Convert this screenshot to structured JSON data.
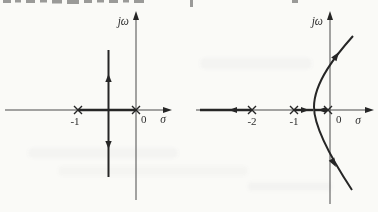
{
  "figure": {
    "type": "root-locus-sketch-pair",
    "ink_color": "#262626",
    "paper_color": "#fafaf7",
    "plots": {
      "left": {
        "y_axis_label": "jω",
        "x_axis_label": "σ",
        "origin_label": "0",
        "tick_labels": [
          "-1"
        ],
        "poles_sigma": [
          -1,
          0
        ],
        "real_axis_locus_segments": [
          [
            -1,
            0
          ]
        ],
        "breakaway_sigma": -0.5,
        "complex_branches": "vertical line through σ = -0.5",
        "branch_arrow_directions": [
          "up",
          "down"
        ]
      },
      "right": {
        "y_axis_label": "jω",
        "x_axis_label": "σ",
        "origin_label": "0",
        "tick_labels": [
          "-2",
          "-1"
        ],
        "poles_sigma": [
          -2,
          -1,
          0
        ],
        "real_axis_locus_segments": [
          [
            "-infinity",
            -2
          ],
          [
            -1,
            -0.4
          ],
          [
            -0.4,
            0
          ]
        ],
        "real_axis_arrow_directions": [
          "left",
          "right-toward-breakaway",
          "left-toward-breakaway"
        ],
        "breakaway_sigma": -0.4,
        "complex_branches": "hyperbola-like pair opening to the right, crossing the jω axis",
        "branch_arrow_directions": [
          "up-right",
          "down-right"
        ]
      }
    }
  }
}
